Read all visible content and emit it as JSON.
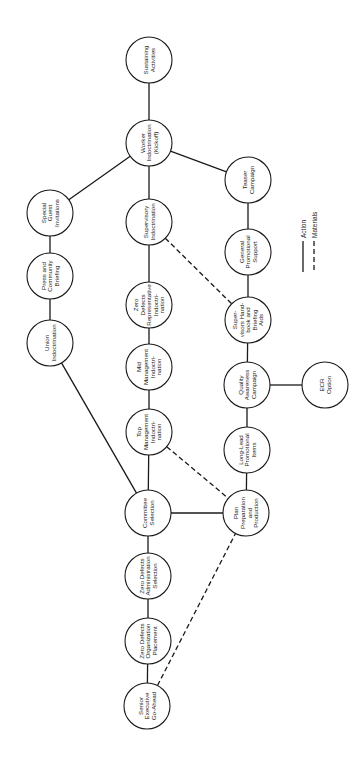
{
  "diagram": {
    "type": "network-flow",
    "orientation": "rotated-90",
    "nodes": [
      {
        "id": "sustaining",
        "label": "Sustaining Activities",
        "lines": [
          "Sustaining",
          "Activities"
        ],
        "cx": 149,
        "cy": 60
      },
      {
        "id": "worker",
        "label": "Worker Indoctrination (Kickoff)",
        "lines": [
          "Worker",
          "Indoctrination",
          "(Kickoff)"
        ],
        "cx": 149,
        "cy": 143
      },
      {
        "id": "teaser",
        "label": "Teaser Campaign",
        "lines": [
          "Teaser",
          "Campaign"
        ],
        "cx": 248,
        "cy": 180
      },
      {
        "id": "special_guest",
        "label": "Special Guest Invitations",
        "lines": [
          "Special",
          "Guest",
          "Invitations"
        ],
        "cx": 50,
        "cy": 213
      },
      {
        "id": "supervisory",
        "label": "Supervisory Indoctrination",
        "lines": [
          "Supervisory",
          "Indoctrination"
        ],
        "cx": 149,
        "cy": 222
      },
      {
        "id": "general_promo",
        "label": "General Promotional Support",
        "lines": [
          "General",
          "Promotional",
          "Support"
        ],
        "cx": 248,
        "cy": 252
      },
      {
        "id": "press",
        "label": "Press and Community Briefing",
        "lines": [
          "Press and",
          "Community",
          "Briefing"
        ],
        "cx": 50,
        "cy": 276
      },
      {
        "id": "zd_rep",
        "label": "Zero Defects Representative Indoctri-nation",
        "lines": [
          "Zero",
          "Defects",
          "Representative",
          "Indoctri-",
          "nation"
        ],
        "cx": 149,
        "cy": 305
      },
      {
        "id": "handbook",
        "label": "Super-visors Hand-book and Briefing Aids",
        "lines": [
          "Super-",
          "visors Hand-",
          "book and",
          "Briefing",
          "Aids"
        ],
        "cx": 248,
        "cy": 320
      },
      {
        "id": "union",
        "label": "Union Indoctrination",
        "lines": [
          "Union",
          "Indoctrination"
        ],
        "cx": 50,
        "cy": 343
      },
      {
        "id": "mid_mgmt",
        "label": "Mid Management Indoctri-nation",
        "lines": [
          "Mid",
          "Management",
          "Indoctri-",
          "nation"
        ],
        "cx": 149,
        "cy": 367
      },
      {
        "id": "quality",
        "label": "Quality Awareness Campaign",
        "lines": [
          "Quality",
          "Awareness",
          "Campaign"
        ],
        "cx": 247,
        "cy": 385
      },
      {
        "id": "ecr",
        "label": "ECR Option",
        "lines": [
          "ECR",
          "Option"
        ],
        "cx": 325,
        "cy": 385
      },
      {
        "id": "top_mgmt",
        "label": "Top Management Indoctri-nation",
        "lines": [
          "Top",
          "Management",
          "Indoctri-",
          "nation"
        ],
        "cx": 149,
        "cy": 432
      },
      {
        "id": "long_lead",
        "label": "Long-Lead Promotional Items",
        "lines": [
          "Long-Lead",
          "Promotional",
          "Items"
        ],
        "cx": 247,
        "cy": 450
      },
      {
        "id": "committee",
        "label": "Committee Selection",
        "lines": [
          "Committee",
          "Selection"
        ],
        "cx": 148,
        "cy": 513
      },
      {
        "id": "plan_prep",
        "label": "Plan Preparation and Production",
        "lines": [
          "Plan",
          "Preparation",
          "and",
          "Production"
        ],
        "cx": 246,
        "cy": 513
      },
      {
        "id": "zd_admin",
        "label": "Zero Defects Administration Selection",
        "lines": [
          "Zero Defects",
          "Administration",
          "Selection"
        ],
        "cx": 148,
        "cy": 576
      },
      {
        "id": "zd_org",
        "label": "Zero Defects Organization Placement",
        "lines": [
          "Zero Defects",
          "Organization",
          "Placement"
        ],
        "cx": 148,
        "cy": 641
      },
      {
        "id": "senior_exec",
        "label": "Senior Executive Go-Ahead",
        "lines": [
          "Senior",
          "Executive",
          "Go-Ahead"
        ],
        "cx": 147,
        "cy": 706
      }
    ],
    "node_radius": 23,
    "edges": [
      {
        "from": "sustaining",
        "to": "worker",
        "type": "action"
      },
      {
        "from": "worker",
        "to": "teaser",
        "type": "action"
      },
      {
        "from": "worker",
        "to": "special_guest",
        "type": "action"
      },
      {
        "from": "worker",
        "to": "supervisory",
        "type": "action"
      },
      {
        "from": "special_guest",
        "to": "press",
        "type": "action"
      },
      {
        "from": "press",
        "to": "union",
        "type": "action"
      },
      {
        "from": "union",
        "to": "committee",
        "type": "action"
      },
      {
        "from": "supervisory",
        "to": "zd_rep",
        "type": "action"
      },
      {
        "from": "supervisory",
        "to": "handbook",
        "type": "materials"
      },
      {
        "from": "zd_rep",
        "to": "mid_mgmt",
        "type": "action"
      },
      {
        "from": "mid_mgmt",
        "to": "top_mgmt",
        "type": "action"
      },
      {
        "from": "top_mgmt",
        "to": "committee",
        "type": "action"
      },
      {
        "from": "top_mgmt",
        "to": "plan_prep",
        "type": "materials"
      },
      {
        "from": "teaser",
        "to": "general_promo",
        "type": "action"
      },
      {
        "from": "general_promo",
        "to": "handbook",
        "type": "action"
      },
      {
        "from": "handbook",
        "to": "quality",
        "type": "action"
      },
      {
        "from": "quality",
        "to": "ecr",
        "type": "action"
      },
      {
        "from": "quality",
        "to": "long_lead",
        "type": "action"
      },
      {
        "from": "long_lead",
        "to": "plan_prep",
        "type": "action"
      },
      {
        "from": "committee",
        "to": "plan_prep",
        "type": "action"
      },
      {
        "from": "committee",
        "to": "zd_admin",
        "type": "action"
      },
      {
        "from": "zd_admin",
        "to": "zd_org",
        "type": "action"
      },
      {
        "from": "zd_org",
        "to": "senior_exec",
        "type": "action"
      },
      {
        "from": "senior_exec",
        "to": "plan_prep",
        "type": "materials"
      }
    ]
  },
  "legend": {
    "action_label": "Action",
    "materials_label": "Materials"
  },
  "colors": {
    "ink": "#1a1a1a",
    "background": "#ffffff"
  }
}
